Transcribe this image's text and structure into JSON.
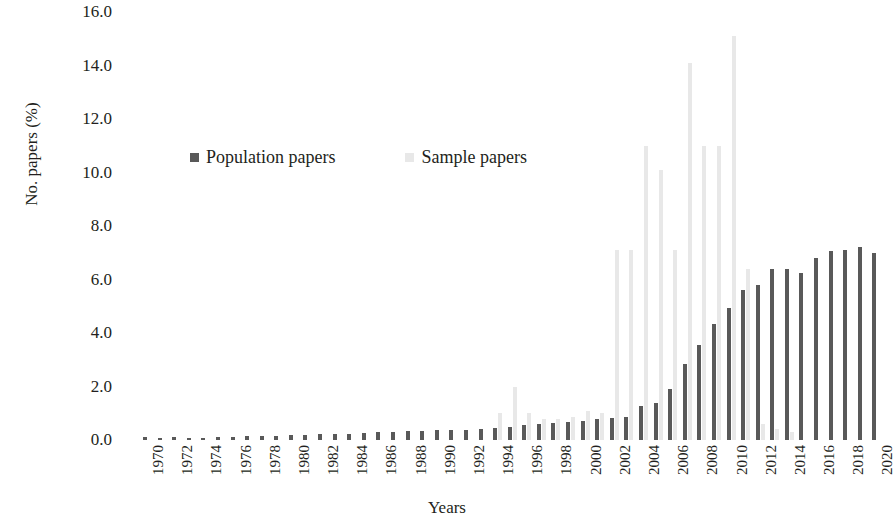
{
  "chart_data": {
    "type": "bar",
    "title": "",
    "xlabel": "Years",
    "ylabel": "No. papers (%)",
    "ylim": [
      0,
      16
    ],
    "ytick_labels": [
      "16.0",
      "14.0",
      "12.0",
      "10.0",
      "8.0",
      "6.0",
      "4.0",
      "2.0",
      "0.0"
    ],
    "ytick_values": [
      16,
      14,
      12,
      10,
      8,
      6,
      4,
      2,
      0
    ],
    "grid": false,
    "legend_position": "inside-top-left",
    "categories": [
      "1970",
      "1971",
      "1972",
      "1973",
      "1974",
      "1975",
      "1976",
      "1977",
      "1978",
      "1979",
      "1980",
      "1981",
      "1982",
      "1983",
      "1984",
      "1985",
      "1986",
      "1987",
      "1988",
      "1989",
      "1990",
      "1991",
      "1992",
      "1993",
      "1994",
      "1995",
      "1996",
      "1997",
      "1998",
      "1999",
      "2000",
      "2001",
      "2002",
      "2003",
      "2004",
      "2005",
      "2006",
      "2007",
      "2008",
      "2009",
      "2010",
      "2011",
      "2012",
      "2013",
      "2014",
      "2015",
      "2016",
      "2017",
      "2018",
      "2019",
      "2020"
    ],
    "xtick_labels": [
      "1970",
      "",
      "1972",
      "",
      "1974",
      "",
      "1976",
      "",
      "1978",
      "",
      "1980",
      "",
      "1982",
      "",
      "1984",
      "",
      "1986",
      "",
      "1988",
      "",
      "1990",
      "",
      "1992",
      "",
      "1994",
      "",
      "1996",
      "",
      "1998",
      "",
      "2000",
      "",
      "2002",
      "",
      "2004",
      "",
      "2006",
      "",
      "2008",
      "",
      "2010",
      "",
      "2012",
      "",
      "2014",
      "",
      "2016",
      "",
      "2018",
      "",
      "2020"
    ],
    "series": [
      {
        "name": "Population papers",
        "color": "#595959",
        "values": [
          0.1,
          0.08,
          0.1,
          0.05,
          0.06,
          0.1,
          0.12,
          0.14,
          0.16,
          0.16,
          0.2,
          0.2,
          0.24,
          0.24,
          0.22,
          0.26,
          0.3,
          0.3,
          0.34,
          0.34,
          0.36,
          0.36,
          0.38,
          0.42,
          0.46,
          0.5,
          0.56,
          0.6,
          0.62,
          0.66,
          0.72,
          0.8,
          0.82,
          0.86,
          1.28,
          1.4,
          1.9,
          2.85,
          3.55,
          4.35,
          4.95,
          5.6,
          5.8,
          6.4,
          6.4,
          6.25,
          6.8,
          7.05,
          7.1,
          7.2,
          7.0
        ]
      },
      {
        "name": "Sample papers",
        "color": "#e8e8e8",
        "values": [
          0.0,
          0.0,
          0.0,
          0.0,
          0.0,
          0.0,
          0.0,
          0.0,
          0.0,
          0.0,
          0.0,
          0.0,
          0.0,
          0.0,
          0.0,
          0.0,
          0.0,
          0.0,
          0.0,
          0.0,
          0.0,
          0.0,
          0.0,
          0.0,
          1.0,
          2.0,
          1.0,
          0.8,
          0.8,
          0.85,
          1.1,
          1.0,
          7.1,
          7.1,
          11.0,
          10.1,
          7.1,
          14.1,
          11.0,
          11.0,
          15.1,
          6.4,
          0.6,
          0.4,
          0.3,
          0.0,
          0.0,
          0.0,
          0.0,
          0.0,
          0.0
        ]
      }
    ]
  },
  "legend": {
    "items": [
      {
        "label": "Population papers",
        "color": "#595959"
      },
      {
        "label": "Sample papers",
        "color": "#e8e8e8"
      }
    ]
  }
}
